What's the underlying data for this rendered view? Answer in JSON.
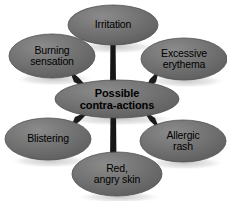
{
  "diagram": {
    "type": "hub-and-spoke",
    "title": "Possible contra-actions",
    "background_color": "#ffffff",
    "node_fill_color": "#6e6e6e",
    "node_edge_color": "#4a4a4a",
    "connector_color": "#1a1a1a",
    "text_color": "#000000",
    "hub": {
      "id": "possible-contra-actions",
      "label": "Possible\ncontra-actions",
      "cx": 117,
      "cy": 99,
      "rx": 62,
      "ry": 19
    },
    "nodes": [
      {
        "id": "irritation",
        "label": "Irritation",
        "position": "top",
        "cx": 113,
        "cy": 25,
        "rx": 45,
        "ry": 20
      },
      {
        "id": "burning-sensation",
        "label": "Burning\nsensation",
        "position": "top-left",
        "cx": 52,
        "cy": 56,
        "rx": 43,
        "ry": 22
      },
      {
        "id": "excessive-erythema",
        "label": "Excessive\nerythema",
        "position": "top-right",
        "cx": 184,
        "cy": 59,
        "rx": 43,
        "ry": 21
      },
      {
        "id": "blistering",
        "label": "Blistering",
        "position": "bottom-left",
        "cx": 48,
        "cy": 139,
        "rx": 43,
        "ry": 21
      },
      {
        "id": "allergic-rash",
        "label": "Allergic\nrash",
        "position": "bottom-right",
        "cx": 183,
        "cy": 141,
        "rx": 43,
        "ry": 21
      },
      {
        "id": "red-angry-skin",
        "label": "Red,\nangry skin",
        "position": "bottom",
        "cx": 117,
        "cy": 174,
        "rx": 45,
        "ry": 22
      }
    ],
    "connectors": [
      {
        "from": "possible-contra-actions",
        "to": "irritation",
        "kind": "vertical"
      },
      {
        "from": "possible-contra-actions",
        "to": "burning-sensation",
        "kind": "diagonal"
      },
      {
        "from": "possible-contra-actions",
        "to": "excessive-erythema",
        "kind": "diagonal"
      },
      {
        "from": "possible-contra-actions",
        "to": "blistering",
        "kind": "diagonal"
      },
      {
        "from": "possible-contra-actions",
        "to": "allergic-rash",
        "kind": "diagonal"
      },
      {
        "from": "possible-contra-actions",
        "to": "red-angry-skin",
        "kind": "vertical"
      }
    ]
  }
}
